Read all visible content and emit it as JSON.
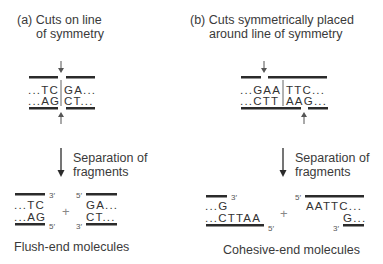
{
  "panel_a": {
    "title_line1": "(a) Cuts on line",
    "title_line2": "of symmetry",
    "top_strand_left": "...TC",
    "top_strand_right": "GA...",
    "bottom_strand_left": "...AG",
    "bottom_strand_right": "CT...",
    "step_line1": "Separation of",
    "step_line2": "fragments",
    "frag_left_top": "...TC",
    "frag_left_bottom": "...AG",
    "frag_right_top": "GA...",
    "frag_right_bottom": "CT...",
    "end_3prime": "3′",
    "end_5prime": "5′",
    "plus": "+",
    "caption": "Flush-end molecules"
  },
  "panel_b": {
    "title_line1": "(b) Cuts symmetrically placed",
    "title_line2": "around line of symmetry",
    "top_strand_left": "...GAA",
    "top_strand_right": "TTC...",
    "bottom_strand_left": "...CTT",
    "bottom_strand_right": "AAG...",
    "step_line1": "Separation of",
    "step_line2": "fragments",
    "frag_left_top": "...G",
    "frag_left_bottom": "...CTTAA",
    "frag_right_top": "AATTC...",
    "frag_right_bottom": "G...",
    "end_3prime": "3′",
    "end_5prime": "5′",
    "plus": "+",
    "caption": "Cohesive-end molecules"
  }
}
